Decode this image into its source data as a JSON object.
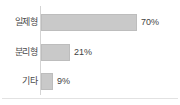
{
  "chart_data": {
    "type": "bar",
    "orientation": "horizontal",
    "title": "",
    "xlabel": "",
    "ylabel": "",
    "categories": [
      "일제형",
      "분리형",
      "기타"
    ],
    "values": [
      70,
      21,
      9
    ],
    "value_labels": [
      "70%",
      "21%",
      "9%"
    ],
    "unit": "%",
    "xlim": [
      0,
      100
    ],
    "grid": false,
    "legend": false,
    "bar_color": "#c9c9c9",
    "bar_border_color": "#bdbdbd",
    "axis_color": "#d4d4d4",
    "text_color": "#4a4a4a"
  },
  "rows": [
    {
      "label": "일제형",
      "value_label": "70%",
      "bar_px": 96
    },
    {
      "label": "분리형",
      "value_label": "21%",
      "bar_px": 29
    },
    {
      "label": "기타",
      "value_label": "9%",
      "bar_px": 12
    }
  ]
}
